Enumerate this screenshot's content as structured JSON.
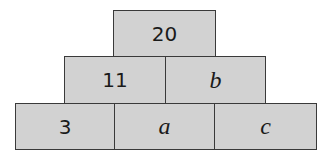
{
  "pyramid": {
    "top": {
      "label": "20"
    },
    "middle": [
      {
        "label": "11"
      },
      {
        "label": "b"
      }
    ],
    "bottom": [
      {
        "label": "3"
      },
      {
        "label": "a"
      },
      {
        "label": "c"
      }
    ],
    "colors": {
      "fill": "#d2d2d2",
      "border": "#3a3a3a",
      "text": "#1a1a1a"
    }
  }
}
